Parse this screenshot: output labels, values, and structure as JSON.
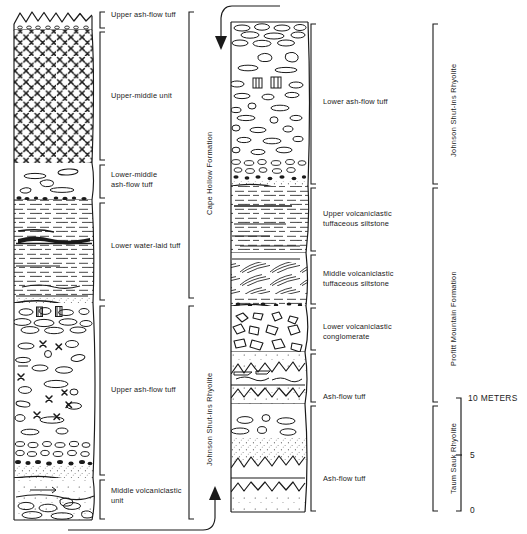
{
  "figure": {
    "type": "stratigraphic-column-diagram",
    "title": "",
    "background_color": "#ffffff",
    "line_color": "#1a1a1a"
  },
  "columns": [
    {
      "id": "left-column",
      "name": "left-stratigraphic-column",
      "units": [
        {
          "label": "Upper ash-flow tuff",
          "lithology": "ash-flow-tuff-sawtooth"
        },
        {
          "label": "Upper-middle unit",
          "lithology": "phenocryst-rich-x-pattern"
        },
        {
          "label": "Lower-middle\nash-flow tuff",
          "lithology": "lapilli-ash-flow-tuff"
        },
        {
          "label": "Lower water-laid tuff",
          "lithology": "bedded-water-laid-tuff"
        },
        {
          "label": "Upper ash-flow tuff",
          "lithology": "lapilli-pumice-ash-flow-tuff"
        },
        {
          "label": "Middle volcaniclastic\nunit",
          "lithology": "volcaniclastic-breccia"
        }
      ],
      "formations": [
        {
          "label": "Cape Hollow Formation"
        },
        {
          "label": "Johnson Shut-ins Rhyolite"
        }
      ]
    },
    {
      "id": "right-column",
      "name": "right-stratigraphic-column",
      "units": [
        {
          "label": "Lower ash-flow tuff",
          "lithology": "lapilli-pumice-ash-flow-tuff"
        },
        {
          "label": "Upper volcaniclastic\ntuffaceous siltstone",
          "lithology": "laminated-siltstone"
        },
        {
          "label": "Middle volcaniclastic\ntuffaceous siltstone",
          "lithology": "cross-bedded-siltstone"
        },
        {
          "label": "Lower volcaniclastic\nconglomerate",
          "lithology": "angular-clast-conglomerate"
        },
        {
          "label": "Ash-flow tuff",
          "lithology": "stippled-ash-flow-tuff"
        },
        {
          "label": "Ash-flow tuff",
          "lithology": "stippled-ash-flow-tuff"
        }
      ],
      "formations": [
        {
          "label": "Johnson Shut-ins Rhyolite"
        },
        {
          "label": "Profitt Mountain Formation"
        },
        {
          "label": "Taum Sauk Rhyolite"
        }
      ]
    }
  ],
  "connectors": [
    {
      "name": "top-continuation-arrow",
      "direction": "down",
      "description": "arrow entering top of right column"
    },
    {
      "name": "bottom-continuation-arrow",
      "direction": "up",
      "description": "arrow from base of left column to base of right column"
    }
  ],
  "scale_bar": {
    "name": "vertical-scale-bar",
    "unit": "METERS",
    "top_label": "10 METERS",
    "mid_label": "5",
    "bottom_label": "0",
    "ticks": [
      10,
      5,
      0
    ]
  }
}
